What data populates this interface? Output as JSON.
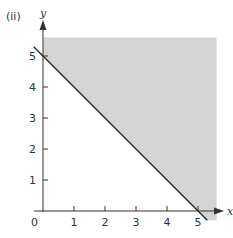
{
  "panel_label": "(ii)",
  "chart_data": {
    "type": "area",
    "title": "",
    "xlabel": "x",
    "ylabel": "y",
    "xlim": [
      0,
      5.6
    ],
    "ylim": [
      0,
      5.6
    ],
    "grid": false,
    "x_ticks": [
      "1",
      "2",
      "3",
      "4",
      "5"
    ],
    "y_ticks": [
      "1",
      "2",
      "3",
      "4",
      "5"
    ],
    "origin_label": "0",
    "boundary_line": {
      "equation": "x + y = 5",
      "points": [
        [
          -0.3,
          5.3
        ],
        [
          5.3,
          -0.3
        ]
      ],
      "style": "solid"
    },
    "shaded_region": {
      "description": "x + y >= 5",
      "vertices": [
        [
          0,
          5
        ],
        [
          0,
          5.6
        ],
        [
          5.6,
          5.6
        ],
        [
          5.6,
          -0.3
        ],
        [
          5.3,
          -0.3
        ]
      ],
      "color": "#d4d4d4"
    }
  },
  "colors": {
    "shade": "#d4d4d4",
    "axis": "#333333",
    "line": "#222222"
  }
}
